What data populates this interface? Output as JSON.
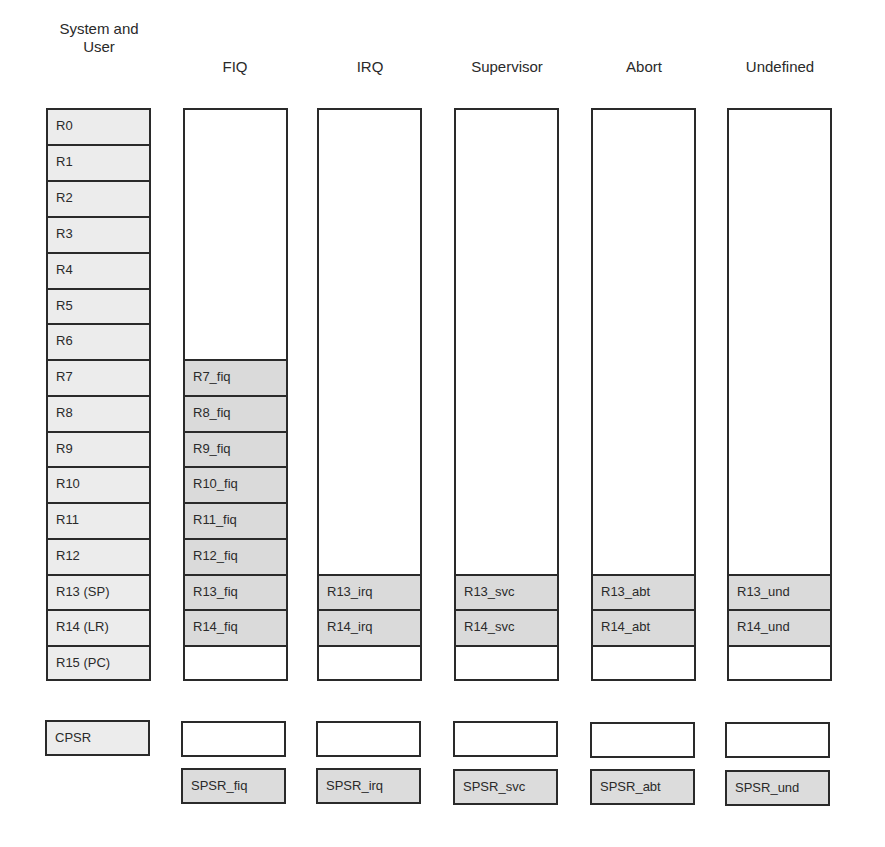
{
  "diagram": {
    "columns": [
      {
        "id": "sys",
        "header": "System and\nUser",
        "header_lines": [
          "System and",
          "User"
        ]
      },
      {
        "id": "fiq",
        "header": "FIQ"
      },
      {
        "id": "irq",
        "header": "IRQ"
      },
      {
        "id": "svc",
        "header": "Supervisor"
      },
      {
        "id": "abt",
        "header": "Abort"
      },
      {
        "id": "und",
        "header": "Undefined"
      }
    ],
    "system_registers": [
      "R0",
      "R1",
      "R2",
      "R3",
      "R4",
      "R5",
      "R6",
      "R7",
      "R8",
      "R9",
      "R10",
      "R11",
      "R12",
      "R13 (SP)",
      "R14 (LR)",
      "R15 (PC)"
    ],
    "banked": {
      "fiq": [
        "R7_fiq",
        "R8_fiq",
        "R9_fiq",
        "R10_fiq",
        "R11_fiq",
        "R12_fiq",
        "R13_fiq",
        "R14_fiq"
      ],
      "irq": [
        "R13_irq",
        "R14_irq"
      ],
      "svc": [
        "R13_svc",
        "R14_svc"
      ],
      "abt": [
        "R13_abt",
        "R14_abt"
      ],
      "und": [
        "R13_und",
        "R14_und"
      ]
    },
    "cpsr": "CPSR",
    "spsr": {
      "fiq": "SPSR_fiq",
      "irq": "SPSR_irq",
      "svc": "SPSR_svc",
      "abt": "SPSR_abt",
      "und": "SPSR_und"
    },
    "colors": {
      "line": "#2a2a2a",
      "system_fill": "#ececec",
      "banked_fill": "#dadada",
      "empty_fill": "#ffffff"
    }
  }
}
